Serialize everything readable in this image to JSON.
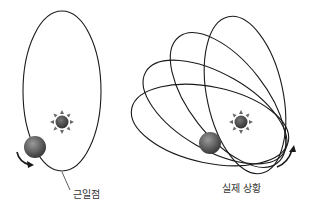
{
  "diagram": {
    "left_panel": {
      "label": "근일점",
      "description": "single elliptical orbit with sun near focus and planet at perihelion"
    },
    "right_panel": {
      "label": "실제 상황",
      "description": "precessing elliptical orbits (multiple rotated ellipses)"
    },
    "icons": {
      "sun": "sun-icon",
      "planet": "planet-icon",
      "arrow": "curved-arrow-icon"
    },
    "colors": {
      "orbit": "#1a1a1a",
      "sun": "#555555",
      "planet": "#6a6a6a",
      "text": "#333333"
    }
  }
}
